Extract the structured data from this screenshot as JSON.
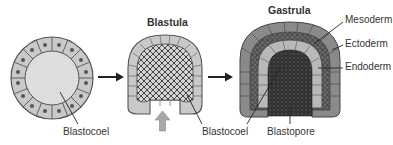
{
  "figure": {
    "stages": [
      {
        "id": "morula-blastula-early",
        "title": ""
      },
      {
        "id": "blastula",
        "title": "Blastula"
      },
      {
        "id": "gastrula",
        "title": "Gastrula"
      }
    ],
    "labels": {
      "blastocoel_1": "Blastocoel",
      "blastocoel_2": "Blastocoel",
      "blastopore": "Blastopore",
      "mesoderm": "Mesoderm",
      "ectoderm": "Ectoderm",
      "endoderm": "Endoderm"
    },
    "colors": {
      "cell_fill": "#c9c9c9",
      "cell_stroke": "#555555",
      "nucleus": "#555555",
      "blastocoel_fill": "#dcdcdc",
      "ectoderm_fill": "#8a8a8a",
      "mesoderm_fill": "#6f6f6f",
      "endoderm_fill": "#b9b9b9",
      "blastopore_core": "#333333",
      "arrow": "#222222",
      "invagination_arrow": "#a8a8a8"
    }
  }
}
